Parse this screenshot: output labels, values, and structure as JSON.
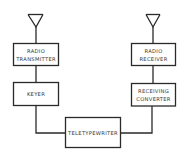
{
  "diagram": {
    "type": "block-diagram",
    "colors": {
      "line": "#2a2a2a",
      "text": "#333333",
      "background": "#ffffff"
    },
    "blocks": [
      {
        "id": "radio_transmitter",
        "line1": "RADIO",
        "line2": "TRANSMITTER"
      },
      {
        "id": "keyer",
        "line1": "KEYER",
        "line2": ""
      },
      {
        "id": "radio_receiver",
        "line1": "RADIO",
        "line2": "RECEIVER"
      },
      {
        "id": "receiving_converter",
        "line1": "RECEIVING",
        "line2": "CONVERTER"
      },
      {
        "id": "teletypewriter",
        "line1": "TELETYPEWRITER",
        "line2": ""
      }
    ],
    "antennas": [
      {
        "id": "transmit_antenna",
        "attached_to": "radio_transmitter"
      },
      {
        "id": "receive_antenna",
        "attached_to": "radio_receiver"
      }
    ],
    "connections": [
      [
        "transmit_antenna",
        "radio_transmitter"
      ],
      [
        "radio_transmitter",
        "keyer"
      ],
      [
        "keyer",
        "teletypewriter"
      ],
      [
        "receive_antenna",
        "radio_receiver"
      ],
      [
        "radio_receiver",
        "receiving_converter"
      ],
      [
        "receiving_converter",
        "teletypewriter"
      ]
    ]
  }
}
